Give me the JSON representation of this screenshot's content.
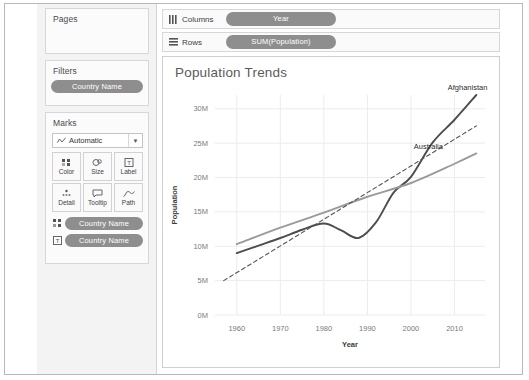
{
  "sidebar": {
    "pages": {
      "title": "Pages"
    },
    "filters": {
      "title": "Filters",
      "pill": "Country Name"
    },
    "marks": {
      "title": "Marks",
      "mark_type": "Automatic",
      "buttons": [
        {
          "label": "Color",
          "icon": "color-squares-icon"
        },
        {
          "label": "Size",
          "icon": "size-circles-icon"
        },
        {
          "label": "Label",
          "icon": "label-text-icon"
        },
        {
          "label": "Detail",
          "icon": "detail-dots-icon"
        },
        {
          "label": "Tooltip",
          "icon": "tooltip-bubble-icon"
        },
        {
          "label": "Path",
          "icon": "path-line-icon"
        }
      ],
      "pills": [
        {
          "label": "Country Name",
          "icon": "color-squares-icon"
        },
        {
          "label": "Country Name",
          "icon": "label-text-icon"
        }
      ]
    }
  },
  "shelves": {
    "columns": {
      "label": "Columns",
      "icon": "columns-icon",
      "pill": "Year"
    },
    "rows": {
      "label": "Rows",
      "icon": "rows-icon",
      "pill": "SUM(Population)"
    }
  },
  "chart": {
    "title": "Population Trends"
  },
  "colors": {
    "pill": "#8e8e8e",
    "afghanistan": "#4d4d4d",
    "australia": "#9a9a9a",
    "trend": "#555555",
    "grid": "#ececec"
  },
  "chart_data": {
    "type": "line",
    "title": "Population Trends",
    "xlabel": "Year",
    "ylabel": "Population",
    "xlim": [
      1955,
      2017
    ],
    "ylim": [
      0,
      32000000
    ],
    "xticks": [
      1960,
      1970,
      1980,
      1990,
      2000,
      2010
    ],
    "yticks": [
      0,
      5000000,
      10000000,
      15000000,
      20000000,
      25000000,
      30000000
    ],
    "ytick_labels": [
      "0M",
      "5M",
      "10M",
      "15M",
      "20M",
      "25M",
      "30M"
    ],
    "grid": true,
    "legend": "in-plot annotations at line ends",
    "series": [
      {
        "name": "Afghanistan",
        "style": "solid",
        "color": "#4d4d4d",
        "x": [
          1960,
          1965,
          1970,
          1975,
          1980,
          1984,
          1988,
          1992,
          1996,
          2000,
          2005,
          2010,
          2015
        ],
        "values": [
          9000000,
          10100000,
          11200000,
          12400000,
          13300000,
          12300000,
          11200000,
          13500000,
          17800000,
          20100000,
          25100000,
          28400000,
          32000000
        ]
      },
      {
        "name": "Australia",
        "style": "solid",
        "color": "#9a9a9a",
        "x": [
          1960,
          1970,
          1980,
          1990,
          2000,
          2010,
          2015
        ],
        "values": [
          10300000,
          12700000,
          14900000,
          17200000,
          19200000,
          22000000,
          23500000
        ]
      },
      {
        "name": "Trend Line",
        "style": "dashed",
        "color": "#555555",
        "x": [
          1957,
          2015
        ],
        "values": [
          5000000,
          27500000
        ]
      }
    ],
    "annotations": [
      {
        "text": "Afghanistan",
        "x": 2013,
        "y": 32800000
      },
      {
        "text": "Australia",
        "x": 2004,
        "y": 24200000
      }
    ]
  }
}
